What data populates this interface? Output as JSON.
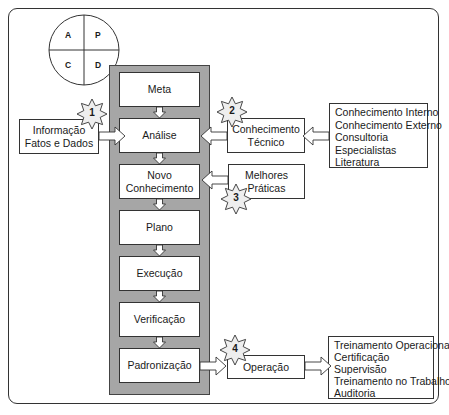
{
  "pdca": {
    "quadrants": [
      "A",
      "P",
      "C",
      "D"
    ]
  },
  "steps": [
    {
      "label": "Meta"
    },
    {
      "label": "Análise"
    },
    {
      "label": "Novo\nConhecimento"
    },
    {
      "label": "Plano"
    },
    {
      "label": "Execução"
    },
    {
      "label": "Verificação"
    },
    {
      "label": "Padronização"
    }
  ],
  "inputs": {
    "informacao": {
      "line1": "Informação",
      "line2": "Fatos e Dados",
      "badge": "1"
    },
    "conhecimento_tecnico": {
      "line1": "Conhecimento",
      "line2": "Técnico",
      "badge": "2"
    },
    "melhores_praticas": {
      "line1": "Melhores",
      "line2": "Práticas",
      "badge": "3"
    },
    "operacao": {
      "label": "Operação",
      "badge": "4"
    }
  },
  "knowledge_sources": [
    "Conhecimento Interno",
    "Conhecimento Externo",
    "Consultoria",
    "Especialistas",
    "Literatura"
  ],
  "operation_items": [
    "Treinamento Operacional",
    "Certificação",
    "Supervisão",
    "Treinamento no Trabalho",
    "Auditoria"
  ],
  "colors": {
    "panel": "#a6a6a6",
    "stroke": "#333333",
    "box": "#ffffff"
  }
}
